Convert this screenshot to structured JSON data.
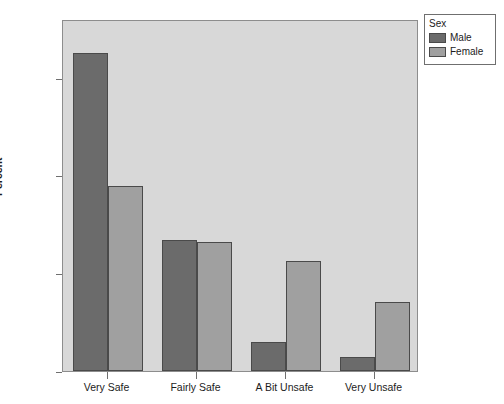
{
  "chart_data": {
    "type": "bar",
    "title": "",
    "subtitle": "",
    "xlabel": "",
    "ylabel": "Percent",
    "categories": [
      "Very Safe",
      "Fairly Safe",
      "A Bit Unsafe",
      "Very Unsafe"
    ],
    "series": [
      {
        "name": "Male",
        "color": "#6b6b6b",
        "values": [
          65.0,
          26.7,
          6.0,
          2.9
        ]
      },
      {
        "name": "Female",
        "color": "#a0a0a0",
        "values": [
          37.9,
          26.3,
          22.6,
          14.1
        ]
      }
    ],
    "ylim": [
      0,
      72
    ],
    "ytick_values": [
      0,
      20,
      40,
      60
    ],
    "ytick_labels": [
      "0.0%",
      "20.0%",
      "40.0%",
      "60.0%"
    ],
    "grid": false,
    "legend_position": "top-right",
    "legend_title": "Sex",
    "plot_background": "#d8d8d8",
    "figure_background": "#ffffff",
    "axis_color": "#8d8d8d"
  },
  "legend": {
    "title": "Sex",
    "entries": [
      {
        "label": "Male",
        "color": "#6b6b6b"
      },
      {
        "label": "Female",
        "color": "#a0a0a0"
      }
    ]
  },
  "axes": {
    "y_title": "Percent",
    "y_ticks": [
      "0.0%",
      "20.0%",
      "40.0%",
      "60.0%"
    ],
    "x_ticks": [
      "Very Safe",
      "Fairly Safe",
      "A Bit Unsafe",
      "Very Unsafe"
    ]
  }
}
